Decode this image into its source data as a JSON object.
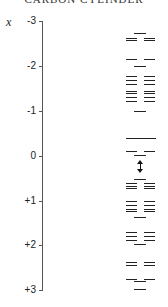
{
  "title": "CARBON CYLINDER",
  "axis": {
    "variable": "x",
    "ticks": [
      {
        "label": "-3",
        "y": 21
      },
      {
        "label": "-2",
        "y": 66
      },
      {
        "label": "-1",
        "y": 111
      },
      {
        "label": "0",
        "y": 156
      },
      {
        "label": "+1",
        "y": 201
      },
      {
        "label": "+2",
        "y": 245
      },
      {
        "label": "+3",
        "y": 290
      }
    ]
  },
  "levels": [
    {
      "y": 33,
      "type": "single"
    },
    {
      "y": 38,
      "type": "pair"
    },
    {
      "y": 40,
      "type": "pair"
    },
    {
      "y": 59,
      "type": "pair"
    },
    {
      "y": 66,
      "type": "single"
    },
    {
      "y": 76,
      "type": "pair"
    },
    {
      "y": 80,
      "type": "pair"
    },
    {
      "y": 84,
      "type": "pair"
    },
    {
      "y": 91,
      "type": "pair"
    },
    {
      "y": 93,
      "type": "pair"
    },
    {
      "y": 97,
      "type": "pair"
    },
    {
      "y": 101,
      "type": "pair"
    },
    {
      "y": 111,
      "type": "single"
    },
    {
      "y": 138,
      "type": "long"
    },
    {
      "y": 151,
      "type": "pair"
    },
    {
      "y": 155,
      "type": "single"
    },
    {
      "y": 179,
      "type": "single"
    },
    {
      "y": 183,
      "type": "pair"
    },
    {
      "y": 186,
      "type": "pair"
    },
    {
      "y": 188,
      "type": "pair"
    },
    {
      "y": 201,
      "type": "pair"
    },
    {
      "y": 205,
      "type": "pair"
    },
    {
      "y": 209,
      "type": "pair"
    },
    {
      "y": 211,
      "type": "pair"
    },
    {
      "y": 217,
      "type": "single"
    },
    {
      "y": 232,
      "type": "pair"
    },
    {
      "y": 236,
      "type": "pair"
    },
    {
      "y": 240,
      "type": "pair"
    },
    {
      "y": 244,
      "type": "single"
    },
    {
      "y": 262,
      "type": "pair"
    },
    {
      "y": 265,
      "type": "pair"
    },
    {
      "y": 279,
      "type": "pair"
    },
    {
      "y": 281,
      "type": "single"
    },
    {
      "y": 289,
      "type": "single"
    }
  ],
  "gap_arrow": {
    "y_top": 160,
    "y_bottom": 173
  }
}
